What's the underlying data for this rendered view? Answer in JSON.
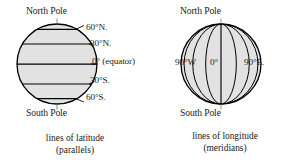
{
  "figure": {
    "background_color": "#ffffff",
    "ink_color": "#000000",
    "globe_fill_color": "#e2e2e2"
  },
  "panels": [
    {
      "id": "latitude",
      "caption_line1": "lines of latitude",
      "caption_line2": "(parallels)",
      "pole_top": "North Pole",
      "pole_bottom": "South Pole",
      "labels": [
        {
          "text": "60°N.",
          "latitude": 60
        },
        {
          "text": "30°N.",
          "latitude": 30
        },
        {
          "text": "0° (equator)",
          "latitude": 0
        },
        {
          "text": "30°S.",
          "latitude": -30
        },
        {
          "text": "60°S.",
          "latitude": -60
        }
      ]
    },
    {
      "id": "longitude",
      "caption_line1": "lines of longitude",
      "caption_line2": "(meridians)",
      "pole_top": "North Pole",
      "pole_bottom": "South Pole",
      "labels": [
        {
          "text": "90°W",
          "longitude": -90
        },
        {
          "text": "0°",
          "longitude": 0
        },
        {
          "text": "90°E.",
          "longitude": 90
        }
      ]
    }
  ]
}
